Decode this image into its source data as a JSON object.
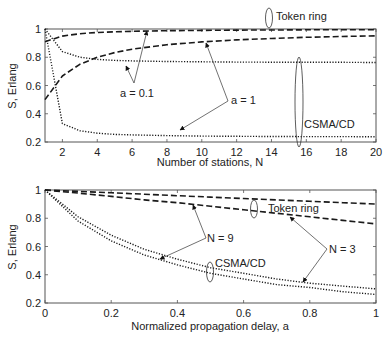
{
  "chart_data": [
    {
      "type": "line",
      "title": "",
      "xlabel": "Number of stations, N",
      "ylabel": "S, Erlang",
      "xlim": [
        1,
        20
      ],
      "ylim": [
        0.2,
        1
      ],
      "xticks": [
        2,
        4,
        6,
        8,
        10,
        12,
        14,
        16,
        18,
        20
      ],
      "yticks": [
        0.2,
        0.4,
        0.6,
        0.8,
        1
      ],
      "grid": false,
      "x": [
        1,
        2,
        3,
        4,
        5,
        6,
        8,
        10,
        12,
        14,
        16,
        18,
        20
      ],
      "series": [
        {
          "name": "Token ring, a = 0.1",
          "style": "dashed",
          "values": [
            0.91,
            0.95,
            0.967,
            0.975,
            0.98,
            0.984,
            0.988,
            0.99,
            0.992,
            0.993,
            0.994,
            0.995,
            0.995
          ]
        },
        {
          "name": "Token ring, a = 1",
          "style": "dashed",
          "values": [
            0.5,
            0.667,
            0.75,
            0.8,
            0.833,
            0.857,
            0.889,
            0.909,
            0.923,
            0.933,
            0.941,
            0.947,
            0.952
          ]
        },
        {
          "name": "CSMA/CD, a = 0.1",
          "style": "dotted",
          "values": [
            1.0,
            0.84,
            0.8,
            0.785,
            0.778,
            0.774,
            0.77,
            0.768,
            0.766,
            0.765,
            0.764,
            0.764,
            0.763
          ]
        },
        {
          "name": "CSMA/CD, a = 1",
          "style": "dotted",
          "values": [
            1.0,
            0.33,
            0.28,
            0.262,
            0.254,
            0.25,
            0.245,
            0.242,
            0.24,
            0.239,
            0.238,
            0.238,
            0.237
          ]
        }
      ],
      "annotations": [
        "Token ring",
        "CSMA/CD",
        "a = 0.1",
        "a = 1"
      ]
    },
    {
      "type": "line",
      "title": "",
      "xlabel": "Normalized propagation delay, a",
      "ylabel": "S, Erlang",
      "xlim": [
        0,
        1
      ],
      "ylim": [
        0.2,
        1
      ],
      "xticks": [
        0,
        0.2,
        0.4,
        0.6,
        0.8,
        1
      ],
      "yticks": [
        0.2,
        0.4,
        0.6,
        0.8,
        1
      ],
      "grid": false,
      "x": [
        0,
        0.1,
        0.2,
        0.3,
        0.4,
        0.5,
        0.6,
        0.7,
        0.8,
        0.9,
        1.0
      ],
      "series": [
        {
          "name": "Token ring, N = 3",
          "style": "dashed",
          "values": [
            1.0,
            0.99,
            0.98,
            0.97,
            0.96,
            0.95,
            0.94,
            0.93,
            0.92,
            0.91,
            0.9
          ]
        },
        {
          "name": "Token ring, N = 9",
          "style": "dashed",
          "values": [
            1.0,
            0.978,
            0.955,
            0.93,
            0.91,
            0.885,
            0.86,
            0.835,
            0.81,
            0.785,
            0.76
          ]
        },
        {
          "name": "CSMA/CD, N = 3",
          "style": "dotted",
          "values": [
            1.0,
            0.81,
            0.68,
            0.58,
            0.51,
            0.45,
            0.41,
            0.37,
            0.34,
            0.32,
            0.3
          ]
        },
        {
          "name": "CSMA/CD, N = 9",
          "style": "dotted",
          "values": [
            1.0,
            0.78,
            0.64,
            0.54,
            0.47,
            0.41,
            0.37,
            0.33,
            0.31,
            0.28,
            0.26
          ]
        }
      ],
      "annotations": [
        "Token ring",
        "CSMA/CD",
        "N = 9",
        "N = 3"
      ]
    }
  ],
  "top_plot": {
    "ylabel": "S, Erlang",
    "xlabel": "Number of stations, N",
    "yticks": [
      "0.2",
      "0.4",
      "0.6",
      "0.8",
      "1"
    ],
    "xticks": [
      "2",
      "4",
      "6",
      "8",
      "10",
      "12",
      "14",
      "16",
      "18",
      "20"
    ],
    "labels": {
      "token_ring": "Token ring",
      "csma_cd": "CSMA/CD",
      "a01": "a = 0.1",
      "a1": "a = 1"
    }
  },
  "bottom_plot": {
    "ylabel": "S, Erlang",
    "xlabel": "Normalized propagation delay, a",
    "yticks": [
      "0.2",
      "0.4",
      "0.6",
      "0.8",
      "1"
    ],
    "xticks": [
      "0",
      "0.2",
      "0.4",
      "0.6",
      "0.8",
      "1"
    ],
    "labels": {
      "token_ring": "Token ring",
      "csma_cd": "CSMA/CD",
      "n9": "N = 9",
      "n3": "N = 3"
    }
  },
  "colors": {
    "axis": "#555555",
    "line": "#1a1a1a",
    "text": "#222222"
  }
}
